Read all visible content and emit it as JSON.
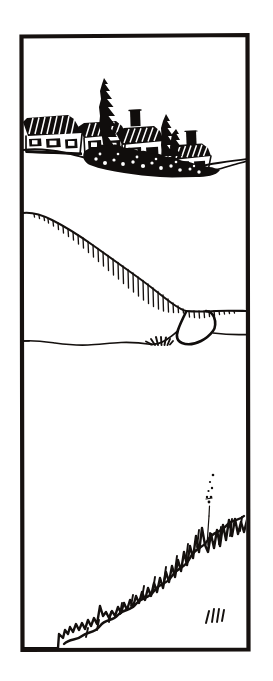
{
  "artwork": {
    "title": "Coastal village above a sloping hillside",
    "medium": "pen-and-ink line drawing",
    "orientation": "portrait",
    "width_px": 273,
    "height_px": 681,
    "background_color": "#ffffff",
    "ink_color": "#100d0c"
  },
  "frame": {
    "name": "rectangular border",
    "stroke_color": "#16110f",
    "stroke_width_px": 4.2,
    "left_px": 21,
    "top_px": 35,
    "right_px": 248,
    "bottom_px": 650
  },
  "regions": [
    {
      "id": "sky",
      "label": "Blank sky area",
      "description": "Empty white space occupying the upper portion above the village silhouette"
    },
    {
      "id": "village",
      "label": "Village silhouette",
      "description": "Row of hatched-roof cottages with chimneys, dark conifer trees and dense shrubbery sitting on a descending ridge",
      "buildings_count": 5,
      "chimneys_count": 3,
      "conifers_count": 3
    },
    {
      "id": "hillside",
      "label": "Hatched sloping hillside",
      "description": "Long diagonal ridge descending left-to-right with vertical hatch strokes growing longer toward the lower right, ending in a rounded promontory"
    },
    {
      "id": "midground",
      "label": "Flat horizon line",
      "description": "Near-horizontal ground line crossing the width of the frame below the hillside"
    },
    {
      "id": "foreground",
      "label": "Rising scrub line",
      "description": "Jagged scribbled shrub and grass line rising from lower left to upper right, with a thin dotted stalk above it"
    }
  ],
  "details": [
    {
      "name": "tall-conifer",
      "label": "Tall conifer tree",
      "position": "left of centre in the village row"
    },
    {
      "name": "chimney",
      "label": "Chimney stack",
      "position": "centre of the village roofline"
    },
    {
      "name": "promontory",
      "label": "Rounded cliff promontory",
      "position": "right end of the hillside"
    },
    {
      "name": "grass-tuft",
      "label": "Small grass tuft",
      "position": "base of the promontory"
    },
    {
      "name": "dotted-stalk",
      "label": "Thin dotted stalk",
      "position": "above the foreground scrub, right of centre"
    },
    {
      "name": "tick-marks",
      "label": "Four short tick marks",
      "position": "lower right corner inside the frame",
      "count": 4
    }
  ]
}
